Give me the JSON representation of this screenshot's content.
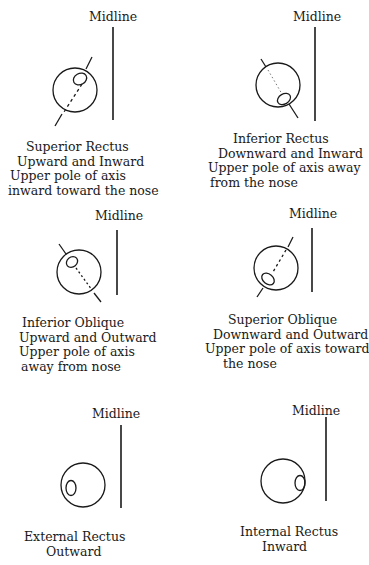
{
  "colors": {
    "ink": "#1a1a1a",
    "background": "#ffffff"
  },
  "panels": [
    {
      "id": "superior-rectus",
      "midline_label": "Midline",
      "title": "Superior Rectus",
      "movement": "Upward and Inward",
      "axis_line1": "Upper pole of axis",
      "axis_line2": "inward toward the nose"
    },
    {
      "id": "inferior-rectus",
      "midline_label": "Midline",
      "title": "Inferior Rectus",
      "movement": "Downward and Inward",
      "axis_line1": "Upper pole of axis away",
      "axis_line2": "from the nose"
    },
    {
      "id": "inferior-oblique",
      "midline_label": "Midline",
      "title": "Inferior Oblique",
      "movement": "Upward and Outward",
      "axis_line1": "Upper pole of axis",
      "axis_line2": "away from nose"
    },
    {
      "id": "superior-oblique",
      "midline_label": "Midline",
      "title": "Superior Oblique",
      "movement": "Downward and Outward",
      "axis_line1": "Upper pole of axis toward",
      "axis_line2": "the nose"
    },
    {
      "id": "external-rectus",
      "midline_label": "Midline",
      "title": "External Rectus",
      "movement": "Outward"
    },
    {
      "id": "internal-rectus",
      "midline_label": "Midline",
      "title": "Internal Rectus",
      "movement": "Inward"
    }
  ]
}
